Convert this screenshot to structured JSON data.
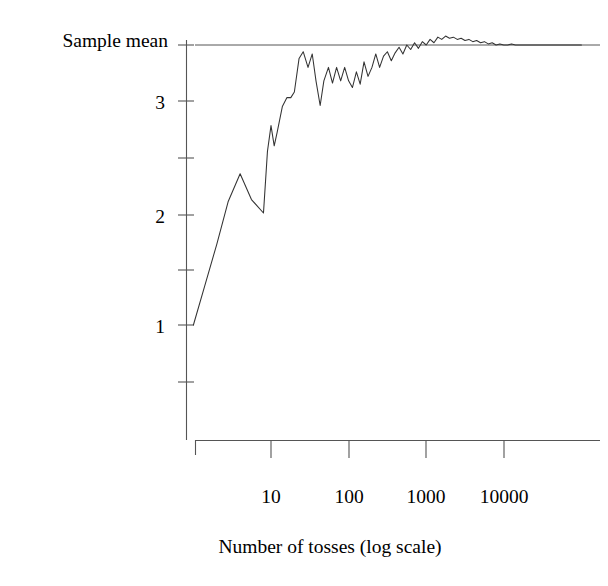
{
  "chart_data": {
    "type": "line",
    "title": "",
    "xlabel": "Number of tosses (log scale)",
    "ylabel": "Sample mean",
    "xscale": "log",
    "grid": false,
    "legend": null,
    "xlim": [
      1,
      100000
    ],
    "ylim": [
      0.5,
      3.65
    ],
    "xticks": [
      10,
      100,
      1000,
      10000
    ],
    "xtick_labels": [
      "10",
      "100",
      "1000",
      "10000"
    ],
    "yticks": [
      0.5,
      1,
      1.5,
      2,
      2.5,
      3,
      3.5
    ],
    "ytick_labels": [
      "",
      "1",
      "",
      "2",
      "",
      "3",
      ""
    ],
    "ytick_labels_visible": [
      "1",
      "2",
      "3"
    ],
    "annotations": [
      {
        "name": "expected-value-reference-line",
        "type": "hline",
        "y": 3.5,
        "label": ""
      }
    ],
    "series": [
      {
        "name": "Sample mean of die tosses",
        "color": "#333333",
        "x": [
          1,
          1.4,
          2,
          2.8,
          4,
          5.6,
          8,
          9,
          10,
          11,
          12,
          14,
          16,
          18,
          20,
          23,
          26,
          30,
          34,
          38,
          43,
          48,
          55,
          62,
          70,
          79,
          89,
          100,
          112,
          126,
          141,
          158,
          178,
          200,
          224,
          251,
          282,
          316,
          355,
          398,
          447,
          501,
          562,
          631,
          708,
          794,
          891,
          1000,
          1122,
          1259,
          1413,
          1585,
          1778,
          1995,
          2239,
          2512,
          2818,
          3162,
          3548,
          3981,
          4467,
          5012,
          5623,
          6310,
          7079,
          7943,
          8913,
          10000,
          11220,
          12589,
          14125,
          15849,
          17783,
          19953,
          22387,
          25119,
          28184,
          31623,
          35481,
          39811,
          44668,
          50119,
          56234,
          63096,
          70795,
          79433,
          89125,
          100000
        ],
        "y": [
          1.0,
          1.35,
          1.72,
          2.1,
          2.35,
          2.12,
          2.0,
          2.55,
          2.78,
          2.6,
          2.72,
          2.95,
          3.03,
          3.03,
          3.08,
          3.38,
          3.44,
          3.3,
          3.42,
          3.18,
          2.96,
          3.18,
          3.3,
          3.16,
          3.3,
          3.18,
          3.3,
          3.18,
          3.12,
          3.26,
          3.15,
          3.35,
          3.22,
          3.3,
          3.42,
          3.3,
          3.4,
          3.44,
          3.36,
          3.43,
          3.48,
          3.42,
          3.5,
          3.46,
          3.52,
          3.47,
          3.53,
          3.5,
          3.55,
          3.52,
          3.57,
          3.55,
          3.58,
          3.56,
          3.57,
          3.55,
          3.56,
          3.54,
          3.55,
          3.53,
          3.54,
          3.52,
          3.53,
          3.51,
          3.52,
          3.5,
          3.51,
          3.5,
          3.5,
          3.51,
          3.5,
          3.5,
          3.5,
          3.5,
          3.5,
          3.5,
          3.5,
          3.5,
          3.5,
          3.5,
          3.5,
          3.5,
          3.5,
          3.5,
          3.5,
          3.5,
          3.5,
          3.5
        ]
      }
    ]
  },
  "axes": {
    "y_title": "Sample mean",
    "x_title": "Number of tosses (log scale)",
    "xtick_1": "10",
    "xtick_2": "100",
    "xtick_3": "1000",
    "xtick_4": "10000",
    "ytick_1": "1",
    "ytick_2": "2",
    "ytick_3": "3"
  },
  "style": {
    "line_color": "#333333",
    "axis_color": "#555555",
    "text_color": "#1a1a1a",
    "background": "#ffffff"
  }
}
